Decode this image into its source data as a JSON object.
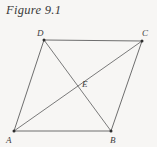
{
  "figure": {
    "caption": "Figure 9.1",
    "background_color": "#f7f6f4",
    "stroke_color": "#6e6e6e",
    "label_color": "#3d3d3d",
    "shape": "parallelogram",
    "vertices": [
      {
        "id": "A",
        "label": "A",
        "x": 14,
        "y": 131,
        "label_x": 6,
        "label_y": 143
      },
      {
        "id": "B",
        "label": "B",
        "x": 111,
        "y": 131,
        "label_x": 110,
        "label_y": 143
      },
      {
        "id": "C",
        "label": "C",
        "x": 142,
        "y": 41,
        "label_x": 142,
        "label_y": 36
      },
      {
        "id": "D",
        "label": "D",
        "x": 44,
        "y": 40,
        "label_x": 37,
        "label_y": 36
      },
      {
        "id": "E",
        "label": "E",
        "x": 78,
        "y": 84,
        "label_x": 82,
        "label_y": 87
      }
    ],
    "edges": [
      {
        "id": "edge-AB",
        "from": "A",
        "to": "B",
        "x1": 14,
        "y1": 131,
        "x2": 111,
        "y2": 131
      },
      {
        "id": "edge-BC",
        "from": "B",
        "to": "C",
        "x1": 111,
        "y1": 131,
        "x2": 142,
        "y2": 41
      },
      {
        "id": "edge-CD",
        "from": "C",
        "to": "D",
        "x1": 142,
        "y1": 41,
        "x2": 44,
        "y2": 40
      },
      {
        "id": "edge-DA",
        "from": "D",
        "to": "A",
        "x1": 44,
        "y1": 40,
        "x2": 14,
        "y2": 131
      }
    ],
    "diagonals": [
      {
        "id": "diagonal-AC",
        "from": "A",
        "to": "C",
        "x1": 14,
        "y1": 131,
        "x2": 142,
        "y2": 41
      },
      {
        "id": "diagonal-DB",
        "from": "D",
        "to": "B",
        "x1": 44,
        "y1": 40,
        "x2": 111,
        "y2": 131
      }
    ]
  }
}
